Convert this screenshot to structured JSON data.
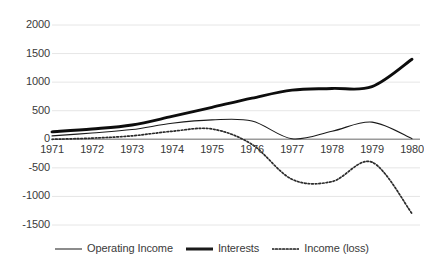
{
  "chart_data": {
    "type": "line",
    "title": "",
    "xlabel": "",
    "ylabel": "",
    "x": [
      1971,
      1972,
      1973,
      1974,
      1975,
      1976,
      1977,
      1978,
      1979,
      1980
    ],
    "categories": [
      "1971",
      "1972",
      "1973",
      "1974",
      "1975",
      "1976",
      "1977",
      "1978",
      "1979",
      "1980"
    ],
    "ylim": [
      -1500,
      2000
    ],
    "yticks": [
      2000,
      1500,
      1000,
      500,
      0,
      -500,
      -1000,
      -1500
    ],
    "ytick_labels": [
      "2000",
      "1500",
      "1000",
      "500",
      "0",
      "-500",
      "-1000",
      "-1500"
    ],
    "grid": true,
    "legend_position": "bottom",
    "series": [
      {
        "name": "Operating Income",
        "style": "solid-thin",
        "color": "#1a1a1a",
        "values": [
          60,
          110,
          170,
          280,
          340,
          320,
          10,
          140,
          300,
          10
        ]
      },
      {
        "name": "Interests",
        "style": "solid-thick",
        "color": "#0d0d0d",
        "values": [
          130,
          180,
          250,
          400,
          560,
          720,
          860,
          890,
          920,
          1400
        ]
      },
      {
        "name": "Income (loss)",
        "style": "dotted",
        "color": "#2b2b2b",
        "values": [
          0,
          20,
          60,
          140,
          180,
          -90,
          -700,
          -740,
          -400,
          -1300
        ]
      }
    ]
  },
  "legend": {
    "items": [
      {
        "label": "Operating Income",
        "style": "solid-thin"
      },
      {
        "label": "Interests",
        "style": "solid-thick"
      },
      {
        "label": "Income (loss)",
        "style": "dotted"
      }
    ]
  }
}
